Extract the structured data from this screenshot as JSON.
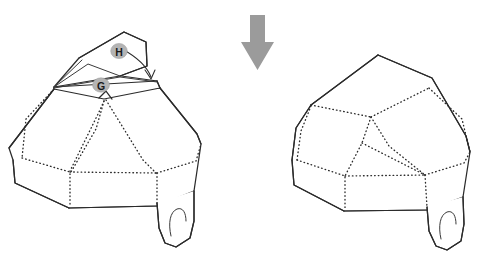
{
  "figure": {
    "background_color": "#ffffff",
    "line_color": "#2b2b2b",
    "arrow_color": "#9b9b9b",
    "badge_fill_color": "#b4b4b4",
    "badge_text_color": "#1a1a1a"
  },
  "labels": {
    "flap_h": "H",
    "flap_g": "G"
  },
  "panels": {
    "before": {
      "name": "before-fold",
      "caption": ""
    },
    "after": {
      "name": "after-fold",
      "caption": ""
    }
  },
  "step_arrow": {
    "direction": "down",
    "color": "#9b9b9b"
  }
}
